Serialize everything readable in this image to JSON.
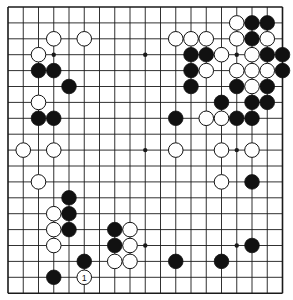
{
  "board": {
    "size": 19,
    "origin_x": 8,
    "origin_y": 7,
    "spacing_x": 15.25,
    "spacing_y": 15.9,
    "line_color": "#1a1a1a",
    "background": "#ffffff",
    "stone_radius": 7.3,
    "star_points": [
      [
        3,
        3
      ],
      [
        9,
        3
      ],
      [
        15,
        3
      ],
      [
        3,
        9
      ],
      [
        9,
        9
      ],
      [
        15,
        9
      ],
      [
        3,
        15
      ],
      [
        9,
        15
      ],
      [
        15,
        15
      ]
    ],
    "black_stones": [
      [
        16,
        1
      ],
      [
        17,
        1
      ],
      [
        16,
        2
      ],
      [
        12,
        3
      ],
      [
        13,
        3
      ],
      [
        17,
        3
      ],
      [
        18,
        3
      ],
      [
        2,
        4
      ],
      [
        3,
        4
      ],
      [
        12,
        4
      ],
      [
        18,
        4
      ],
      [
        4,
        5
      ],
      [
        12,
        5
      ],
      [
        15,
        5
      ],
      [
        17,
        5
      ],
      [
        14,
        6
      ],
      [
        16,
        6
      ],
      [
        17,
        6
      ],
      [
        2,
        7
      ],
      [
        3,
        7
      ],
      [
        11,
        7
      ],
      [
        15,
        7
      ],
      [
        16,
        7
      ],
      [
        16,
        11
      ],
      [
        4,
        12
      ],
      [
        4,
        13
      ],
      [
        4,
        14
      ],
      [
        7,
        14
      ],
      [
        7,
        15
      ],
      [
        16,
        15
      ],
      [
        5,
        16
      ],
      [
        11,
        16
      ],
      [
        14,
        16
      ],
      [
        3,
        17
      ]
    ],
    "white_stones": [
      [
        15,
        1
      ],
      [
        3,
        2
      ],
      [
        5,
        2
      ],
      [
        11,
        2
      ],
      [
        12,
        2
      ],
      [
        13,
        2
      ],
      [
        15,
        2
      ],
      [
        17,
        2
      ],
      [
        2,
        3
      ],
      [
        14,
        3
      ],
      [
        16,
        3
      ],
      [
        13,
        4
      ],
      [
        15,
        4
      ],
      [
        16,
        4
      ],
      [
        17,
        4
      ],
      [
        16,
        5
      ],
      [
        2,
        6
      ],
      [
        13,
        7
      ],
      [
        14,
        7
      ],
      [
        1,
        9
      ],
      [
        3,
        9
      ],
      [
        11,
        9
      ],
      [
        14,
        9
      ],
      [
        16,
        9
      ],
      [
        2,
        11
      ],
      [
        14,
        11
      ],
      [
        3,
        13
      ],
      [
        3,
        14
      ],
      [
        8,
        14
      ],
      [
        3,
        15
      ],
      [
        8,
        15
      ],
      [
        7,
        16
      ],
      [
        8,
        16
      ],
      [
        5,
        17
      ]
    ],
    "labeled_stones": [
      {
        "col": 5,
        "row": 17,
        "color": "white",
        "label": "1"
      }
    ]
  }
}
